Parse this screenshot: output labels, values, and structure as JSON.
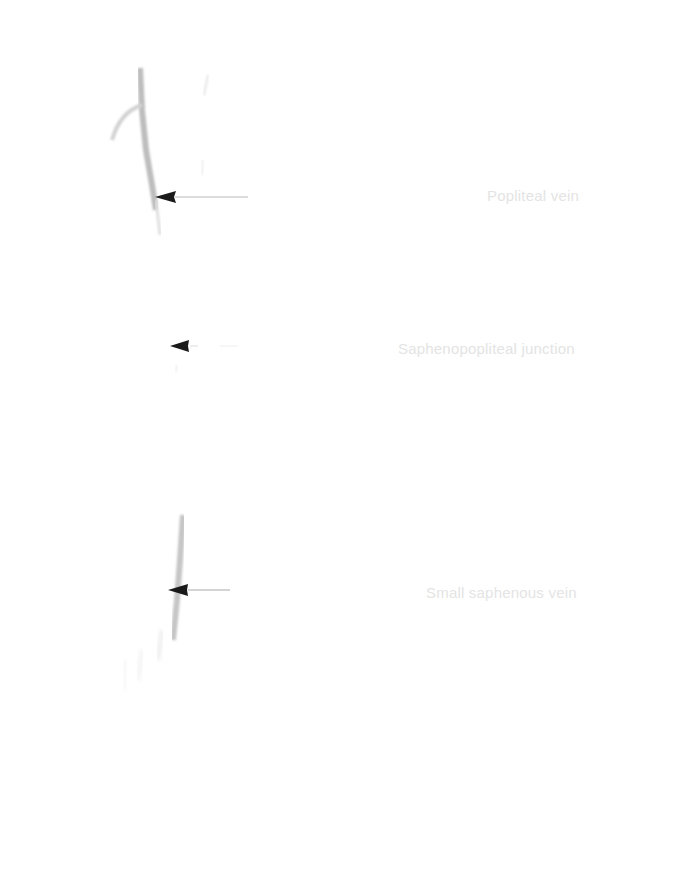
{
  "figure": {
    "labels": [
      {
        "id": "popliteal",
        "text": "Popliteal vein"
      },
      {
        "id": "junction",
        "text": "Saphenopopliteal junction"
      },
      {
        "id": "small",
        "text": "Small saphenous vein"
      }
    ],
    "colors": {
      "background": "#ffffff",
      "label": "#e4e4e4",
      "arrowhead": "#1a1a1a",
      "arrow_line": "#b8b8b8",
      "vein": "#c8c8c8"
    }
  }
}
